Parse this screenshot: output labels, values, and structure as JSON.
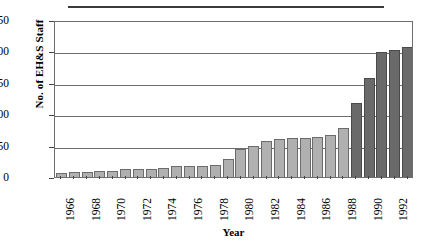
{
  "figure": {
    "top_rule": "horizontal-rule",
    "background_color": "#ffffff"
  },
  "chart_data": {
    "type": "bar",
    "title": "",
    "xlabel": "Year",
    "ylabel": "No. of EH&S Staff",
    "ylim": [
      0,
      250
    ],
    "ytick_values": [
      0,
      50,
      100,
      150,
      200,
      250
    ],
    "ytick_labels": [
      "0",
      "50",
      "100",
      "150",
      "200",
      "250"
    ],
    "grid": true,
    "grid_axis": "y",
    "legend": "none",
    "xtick_labels_shown": [
      "1966",
      "1968",
      "1970",
      "1972",
      "1974",
      "1976",
      "1978",
      "1980",
      "1982",
      "1984",
      "1986",
      "1988",
      "1990",
      "1992"
    ],
    "xtick_label_rotation": -90,
    "categories": [
      "1966",
      "1967",
      "1968",
      "1969",
      "1970",
      "1971",
      "1972",
      "1973",
      "1974",
      "1975",
      "1976",
      "1977",
      "1978",
      "1979",
      "1980",
      "1981",
      "1982",
      "1983",
      "1984",
      "1985",
      "1986",
      "1987",
      "1988",
      "1989",
      "1990",
      "1991",
      "1992",
      "1993"
    ],
    "values": [
      6,
      8,
      8,
      9,
      10,
      12,
      12,
      13,
      15,
      18,
      18,
      17,
      19,
      29,
      45,
      50,
      58,
      61,
      62,
      62,
      63,
      67,
      78,
      118,
      157,
      199,
      202,
      207
    ],
    "bar_colors": [
      "light",
      "light",
      "light",
      "light",
      "light",
      "light",
      "light",
      "light",
      "light",
      "light",
      "light",
      "light",
      "light",
      "light",
      "light",
      "light",
      "light",
      "light",
      "light",
      "light",
      "light",
      "light",
      "light",
      "dark",
      "dark",
      "dark",
      "dark",
      "dark"
    ],
    "color_light": "#b0b0b0",
    "color_dark": "#6a6a6a",
    "border_color": "#6b6b6b"
  }
}
